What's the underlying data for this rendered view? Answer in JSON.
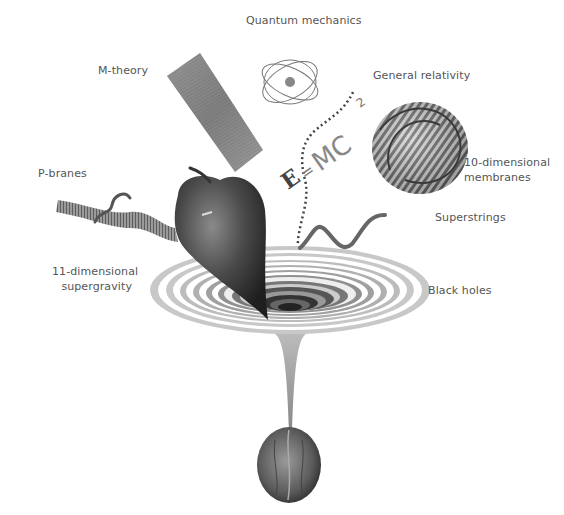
{
  "diagram": {
    "title_hidden": "",
    "labels": {
      "quantum_mechanics": "Quantum  mechanics",
      "m_theory": "M-theory",
      "general_relativity": "General relativity",
      "p_branes": "P-branes",
      "ten_dim_line1": "10-dimensional",
      "ten_dim_line2": "membranes",
      "superstrings": "Superstrings",
      "eleven_dim_line1": "11-dimensional",
      "eleven_dim_line2": "supergravity",
      "black_holes": "Black holes"
    },
    "equation": "E=MC²",
    "objects": [
      "m-theory-sheet",
      "atom",
      "wavy-dotted-line",
      "emc2-equation",
      "knotted-membrane",
      "p-brane-ribbon",
      "apple",
      "superstring",
      "black-hole-funnel",
      "walnut"
    ],
    "colors": {
      "label_text": "#555555",
      "ring_light": "#c8c8c8",
      "ring_dark": "#3a3a3a",
      "apple": "#4a4a4a",
      "sheet": "#8a8a8a"
    }
  }
}
